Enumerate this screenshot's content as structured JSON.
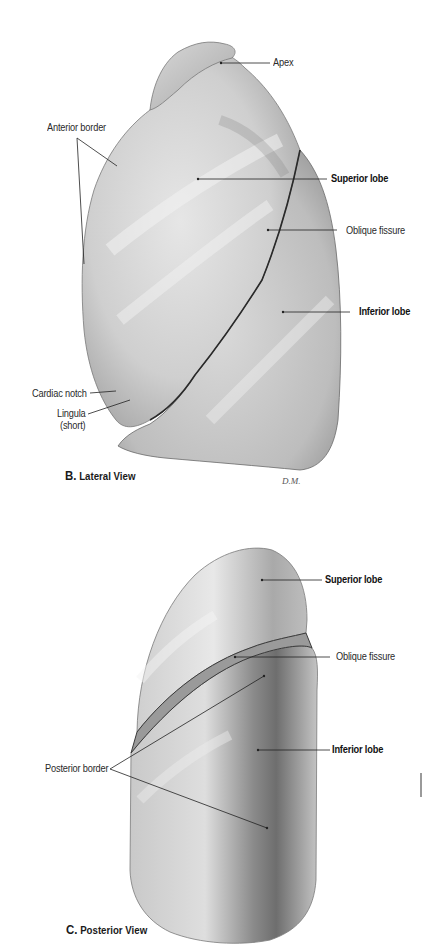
{
  "figure_b": {
    "caption_letter": "B.",
    "caption_text": "Lateral View",
    "signature": "D.M.",
    "labels": {
      "apex": "Apex",
      "anterior_border": "Anterior border",
      "superior_lobe": "Superior lobe",
      "oblique_fissure": "Oblique fissure",
      "inferior_lobe": "Inferior lobe",
      "cardiac_notch": "Cardiac notch",
      "lingula_line1": "Lingula",
      "lingula_line2": "(short)"
    }
  },
  "figure_c": {
    "caption_letter": "C.",
    "caption_text": "Posterior View",
    "labels": {
      "superior_lobe": "Superior lobe",
      "oblique_fissure": "Oblique fissure",
      "inferior_lobe": "Inferior lobe",
      "posterior_border": "Posterior border"
    }
  }
}
